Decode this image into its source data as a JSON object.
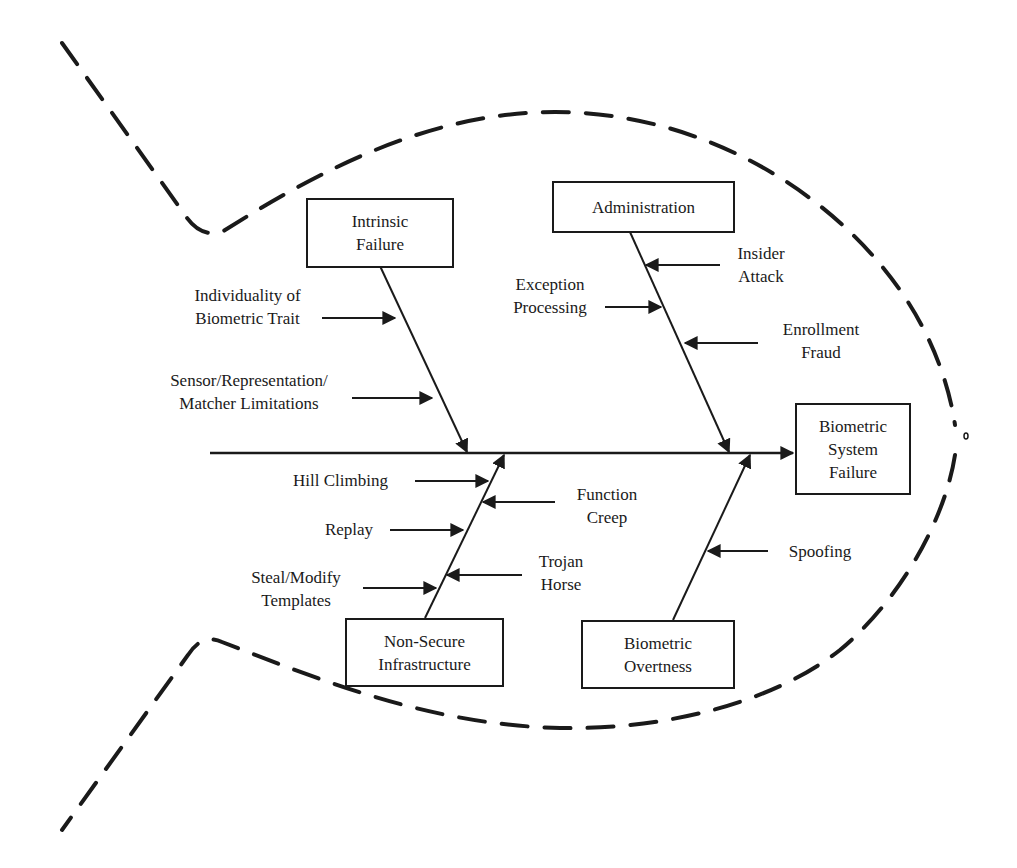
{
  "diagram": {
    "type": "fishbone",
    "effect": "Biometric\nSystem\nFailure",
    "categories": [
      {
        "id": "intrinsic",
        "label": "Intrinsic\nFailure",
        "causes": [
          "Individuality of\nBiometric Trait",
          "Sensor/Representation/\nMatcher Limitations"
        ]
      },
      {
        "id": "administration",
        "label": "Administration",
        "causes": [
          "Insider\nAttack",
          "Exception\nProcessing",
          "Enrollment\nFraud"
        ]
      },
      {
        "id": "infrastructure",
        "label": "Non-Secure\nInfrastructure",
        "causes": [
          "Hill Climbing",
          "Function\nCreep",
          "Replay",
          "Trojan\nHorse",
          "Steal/Modify\nTemplates"
        ]
      },
      {
        "id": "overtness",
        "label": "Biometric\nOvertness",
        "causes": [
          "Spoofing"
        ]
      }
    ]
  },
  "colors": {
    "line": "#1a1a1a",
    "background": "#ffffff"
  }
}
